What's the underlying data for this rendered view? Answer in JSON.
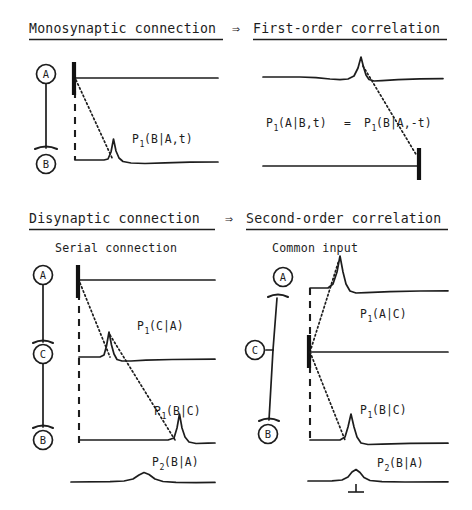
{
  "figure": {
    "caption_implied": "Monosynaptic and disynaptic connections and their correlation orders",
    "arrow_glyph": "⇒"
  },
  "sections": [
    {
      "id": "monosynaptic",
      "left_header": "Monosynaptic connection",
      "arrow": "⇒",
      "right_header": "First-order correlation",
      "subtitles": [],
      "left_panel": {
        "circuit": {
          "nodes": [
            "A",
            "B"
          ],
          "type": "serial-chain",
          "synapses": [
            "A→B"
          ]
        },
        "traces": [
          {
            "name": "trigger-A",
            "role": "reference spike",
            "has_spike_bar": true,
            "spike_position": "left"
          },
          {
            "name": "response-B",
            "role": "correlogram",
            "peak": "early-sharp",
            "label": "P1(B|A,t)"
          }
        ],
        "labels": [
          {
            "base": "P",
            "sub": "1",
            "rest": "(B|A,t)"
          }
        ]
      },
      "right_panel": {
        "traces": [
          {
            "name": "response-A",
            "role": "correlogram",
            "peak": "late-sharp"
          },
          {
            "name": "trigger-B",
            "role": "reference spike",
            "has_spike_bar": true,
            "spike_position": "right"
          }
        ],
        "equation": {
          "left": {
            "base": "P",
            "sub": "1",
            "rest": "(A|B,t)"
          },
          "operator": "=",
          "right": {
            "base": "P",
            "sub": "1",
            "rest": "(B|A,-t)"
          }
        }
      }
    },
    {
      "id": "disynaptic",
      "left_header": "Disynaptic connection",
      "arrow": "⇒",
      "right_header": "Second-order correlation",
      "subtitles": [
        "Serial connection",
        "Common input"
      ],
      "left_panel": {
        "subtitle": "Serial connection",
        "circuit": {
          "nodes": [
            "A",
            "C",
            "B"
          ],
          "type": "serial-chain",
          "synapses": [
            "A→C",
            "C→B"
          ]
        },
        "traces": [
          {
            "name": "trigger-A",
            "role": "reference spike",
            "has_spike_bar": true,
            "spike_position": "left"
          },
          {
            "name": "response-C",
            "role": "correlogram",
            "peak": "early-sharp",
            "label": "P1(C|A)"
          },
          {
            "name": "response-B",
            "role": "correlogram",
            "peak": "mid-sharp",
            "label": "P1(B|C)"
          },
          {
            "name": "second-order-B-A",
            "role": "second-order correlogram",
            "peak": "broad-low",
            "label": "P2(B|A)"
          }
        ],
        "labels": [
          {
            "base": "P",
            "sub": "1",
            "rest": "(C|A)"
          },
          {
            "base": "P",
            "sub": "1",
            "rest": "(B|C)"
          },
          {
            "base": "P",
            "sub": "2",
            "rest": "(B|A)"
          }
        ]
      },
      "right_panel": {
        "subtitle": "Common input",
        "circuit": {
          "nodes": [
            "A",
            "C",
            "B"
          ],
          "type": "common-input",
          "synapses": [
            "C→A",
            "C→B"
          ]
        },
        "traces": [
          {
            "name": "response-A",
            "role": "correlogram",
            "peak": "early-sharp",
            "label": "P1(A|C)"
          },
          {
            "name": "trigger-C",
            "role": "reference spike",
            "has_spike_bar": true,
            "spike_position": "left"
          },
          {
            "name": "response-B",
            "role": "correlogram",
            "peak": "mid-sharp",
            "label": "P1(B|C)"
          },
          {
            "name": "second-order-B-A",
            "role": "second-order correlogram",
            "peak": "broad-low",
            "label": "P2(B|A)",
            "has_zero_tick": true
          }
        ],
        "labels": [
          {
            "base": "P",
            "sub": "1",
            "rest": "(A|C)"
          },
          {
            "base": "P",
            "sub": "1",
            "rest": "(B|C)"
          },
          {
            "base": "P",
            "sub": "2",
            "rest": "(B|A)"
          }
        ]
      }
    }
  ],
  "colors": {
    "ink": "#1d1d1d",
    "spike": "#111111",
    "background": "#ffffff"
  }
}
